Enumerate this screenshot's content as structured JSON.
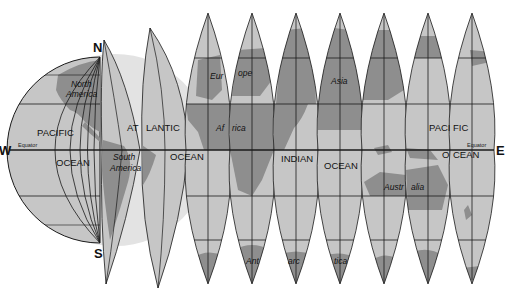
{
  "colors": {
    "land": "#8e8e8e",
    "ocean": "#c6c6c6",
    "shadow": "#e3e3e3",
    "grid": "#1a1a1a",
    "background": "#ffffff"
  },
  "compass": {
    "north": "N",
    "south": "S",
    "west": "W",
    "east": "E"
  },
  "equator_labels": [
    "Equator",
    "Equator"
  ],
  "oceans": {
    "pacific_west_1": "PACIFIC",
    "pacific_west_2": "OCEAN",
    "atlantic_1": "AT",
    "atlantic_2": "LANTIC",
    "atlantic_3": "OCEAN",
    "indian_1": "INDIAN",
    "indian_2": "OCEAN",
    "pacific_east_1": "PACI",
    "pacific_east_2": "FIC",
    "pacific_east_3": "O",
    "pacific_east_4": "CEAN"
  },
  "continents": {
    "north_america_1": "North",
    "north_america_2": "America",
    "south_america_1": "South",
    "south_america_2": "America",
    "europe_1": "Eur",
    "europe_2": "ope",
    "africa_1": "Af",
    "africa_2": "rica",
    "asia": "Asia",
    "australia_1": "Austr",
    "australia_2": "alia",
    "antarctica_1": "Ant",
    "antarctica_2": "arc",
    "antarctica_3": "tica"
  },
  "gore_count": 9
}
